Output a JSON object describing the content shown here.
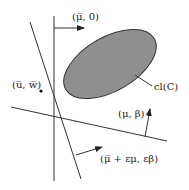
{
  "diagram": {
    "labels": {
      "top_arrow": "(μ̅, 0)",
      "point": "(u̅, w̅)",
      "set": "cl(C)",
      "right_arrow": "(μ, β)",
      "bottom_arrow": "(μ̅ + εμ, εβ)"
    },
    "colors": {
      "set_fill": "#8f8f8f",
      "set_stroke": "#333333",
      "line": "#333333"
    }
  }
}
